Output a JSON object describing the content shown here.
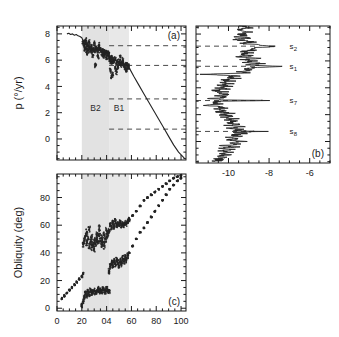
{
  "figure": {
    "background": "#ffffff",
    "frame_color": "#1a1a1a",
    "band_color": "#e2e2e2",
    "data_color": "#242424"
  },
  "panels": {
    "a": {
      "id_label": "(a)",
      "ylabel": "p (°/yr)",
      "yticks": [
        "0",
        "2",
        "4",
        "6",
        "8"
      ],
      "ytick_values": [
        0,
        2,
        4,
        6,
        8
      ],
      "ylim": [
        -1.6,
        8.6
      ],
      "xlim": [
        0,
        104
      ],
      "xticks_major": [
        0,
        20,
        40,
        60,
        80,
        100
      ],
      "bands": [
        {
          "label": "B2",
          "x0": 20,
          "x1": 42
        },
        {
          "label": "B1",
          "x0": 42,
          "x1": 58
        }
      ],
      "resonance_lines": [
        7.1,
        5.6,
        3.05,
        0.75
      ]
    },
    "b": {
      "id_label": "(b)",
      "xlabel": "",
      "xticks": [
        "-10",
        "-8",
        "-6"
      ],
      "xtick_values": [
        -10,
        -8,
        -6
      ],
      "xlim": [
        -11.6,
        -5.0
      ],
      "ylim": [
        -1.6,
        8.6
      ],
      "peak_labels": [
        {
          "text": "s",
          "sub": "2",
          "p": 7.1
        },
        {
          "text": "s",
          "sub": "1",
          "p": 5.6
        },
        {
          "text": "s",
          "sub": "7",
          "p": 3.05
        },
        {
          "text": "s",
          "sub": "8",
          "p": 0.75
        }
      ]
    },
    "c": {
      "id_label": "(c)",
      "ylabel": "Obliquity (deg)",
      "yticks": [
        "0",
        "20",
        "40",
        "60",
        "80"
      ],
      "ytick_values": [
        0,
        20,
        40,
        60,
        80
      ],
      "ylim": [
        -2,
        97
      ],
      "xlim": [
        0,
        104
      ],
      "xticks": [
        "0",
        "20",
        "04",
        "60",
        "80",
        "100"
      ],
      "xtick_values": [
        0,
        20,
        40,
        60,
        80,
        100
      ],
      "bands": [
        {
          "label": "B2",
          "x0": 20,
          "x1": 42
        },
        {
          "label": "B1",
          "x0": 42,
          "x1": 58
        }
      ]
    }
  },
  "chart_data": {
    "type": "scatter",
    "title": "",
    "panel_a": {
      "type": "scatter",
      "xlabel": "",
      "ylabel": "p (°/yr)",
      "xlim": [
        0,
        104
      ],
      "ylim": [
        -1.6,
        8.6
      ],
      "grid": false,
      "series": [
        {
          "name": "precession-rate-branch-upper",
          "comment": "smooth track from x~8 to x~21 near p=8",
          "x": [
            8,
            9.5,
            11,
            12.5,
            14,
            15.5,
            17,
            18.5,
            20,
            21
          ],
          "y": [
            8.0,
            8.05,
            7.95,
            8.0,
            7.9,
            7.95,
            7.85,
            7.8,
            7.7,
            7.5
          ]
        },
        {
          "name": "precession-rate-scatter-B2",
          "comment": "dense chaotic scatter inside band B2",
          "x": [
            21,
            22,
            22.5,
            23,
            24,
            24.5,
            25,
            26,
            27,
            27.5,
            28,
            29,
            30,
            31,
            32,
            33,
            34,
            35,
            36,
            37,
            38,
            39,
            40,
            41,
            41.8,
            23,
            26,
            30,
            34,
            38,
            40,
            24,
            29,
            33,
            37,
            31
          ],
          "y": [
            7.4,
            7.1,
            6.8,
            7.3,
            6.9,
            7.2,
            6.7,
            6.95,
            6.8,
            7.05,
            6.75,
            6.85,
            6.7,
            6.9,
            6.8,
            6.7,
            6.85,
            6.75,
            6.6,
            6.7,
            6.65,
            6.6,
            6.55,
            6.5,
            6.45,
            7.5,
            7.4,
            7.3,
            7.15,
            6.35,
            6.2,
            6.6,
            6.4,
            6.3,
            6.45,
            5.6
          ]
        },
        {
          "name": "precession-rate-scatter-B1",
          "comment": "scatter inside band B1 clustering near 5.6",
          "x": [
            42,
            42.5,
            43,
            43.5,
            44,
            44.5,
            45,
            46,
            47,
            48,
            49,
            50,
            51,
            52,
            53,
            54,
            55,
            56,
            57,
            57.8,
            43,
            45,
            47,
            49,
            51,
            53,
            55,
            44,
            48,
            52,
            56
          ],
          "y": [
            6.3,
            6.0,
            6.15,
            5.9,
            6.2,
            5.85,
            6.05,
            5.95,
            6.1,
            5.8,
            5.9,
            5.75,
            5.85,
            5.7,
            5.8,
            5.65,
            5.7,
            5.6,
            5.55,
            5.5,
            5.2,
            4.9,
            5.35,
            5.5,
            6.2,
            6.0,
            5.4,
            4.7,
            5.1,
            5.65,
            5.3
          ]
        },
        {
          "name": "precession-rate-branch-lower",
          "comment": "near linear decline from (58,5.5) to (103,-1.5)",
          "x": [
            58,
            62,
            66,
            70,
            74,
            78,
            82,
            86,
            90,
            94,
            98,
            103
          ],
          "y": [
            5.45,
            4.75,
            4.1,
            3.45,
            2.8,
            2.15,
            1.5,
            0.85,
            0.2,
            -0.45,
            -1.0,
            -1.5
          ]
        }
      ],
      "shaded_bands": [
        {
          "label": "B2",
          "x0": 20,
          "x1": 42
        },
        {
          "label": "B1",
          "x0": 42,
          "x1": 58
        }
      ],
      "horizontal_dashed_lines": [
        7.1,
        5.6,
        3.05,
        0.75
      ]
    },
    "panel_b": {
      "type": "line",
      "comment": "frequency-analysis amplitude spectrum plotted sideways; x axis is log amplitude, y axis is p (deg/yr)",
      "xlabel": "",
      "ylabel": "p (°/yr)",
      "xlim": [
        -11.6,
        -5.0
      ],
      "ylim": [
        -1.6,
        8.6
      ],
      "grid": false,
      "annotations": [
        {
          "label": "s2",
          "p": 7.1,
          "amplitude": -7.6
        },
        {
          "label": "s1",
          "p": 5.6,
          "amplitude": -7.4
        },
        {
          "label": "s7",
          "p": 3.05,
          "amplitude": -7.7
        },
        {
          "label": "s8",
          "p": 0.75,
          "amplitude": -8.3
        }
      ],
      "spectrum": {
        "p": [
          8.6,
          8.45,
          8.3,
          8.15,
          8.0,
          7.9,
          7.8,
          7.7,
          7.6,
          7.5,
          7.4,
          7.3,
          7.2,
          7.1,
          7.0,
          6.9,
          6.8,
          6.7,
          6.6,
          6.5,
          6.4,
          6.3,
          6.2,
          6.1,
          6.0,
          5.9,
          5.8,
          5.7,
          5.6,
          5.5,
          5.4,
          5.3,
          5.2,
          5.1,
          5.0,
          4.9,
          4.8,
          4.7,
          4.6,
          4.5,
          4.4,
          4.3,
          4.2,
          4.1,
          4.0,
          3.9,
          3.8,
          3.7,
          3.6,
          3.5,
          3.4,
          3.3,
          3.2,
          3.1,
          3.05,
          3.0,
          2.9,
          2.8,
          2.7,
          2.6,
          2.5,
          2.4,
          2.3,
          2.2,
          2.1,
          2.0,
          1.9,
          1.8,
          1.7,
          1.6,
          1.5,
          1.4,
          1.3,
          1.2,
          1.1,
          1.0,
          0.9,
          0.8,
          0.75,
          0.7,
          0.6,
          0.5,
          0.4,
          0.3,
          0.2,
          0.1,
          0.0,
          -0.1,
          -0.2,
          -0.3,
          -0.4,
          -0.5,
          -0.6,
          -0.7,
          -0.8,
          -0.9,
          -1.0,
          -1.1,
          -1.2,
          -1.3,
          -1.4,
          -1.5
        ],
        "amplitude": [
          -9.3,
          -9.0,
          -9.5,
          -8.9,
          -9.4,
          -9.1,
          -9.7,
          -9.0,
          -9.6,
          -9.2,
          -8.8,
          -9.4,
          -8.6,
          -7.6,
          -8.5,
          -9.0,
          -8.7,
          -9.3,
          -8.8,
          -9.4,
          -8.9,
          -9.5,
          -8.6,
          -9.2,
          -8.7,
          -9.3,
          -8.4,
          -9.0,
          -7.4,
          -8.8,
          -9.3,
          -8.9,
          -9.6,
          -9.1,
          -11.2,
          -9.4,
          -10.0,
          -9.6,
          -10.2,
          -9.8,
          -10.4,
          -9.9,
          -10.5,
          -10.0,
          -10.6,
          -10.1,
          -10.7,
          -10.2,
          -10.5,
          -10.0,
          -10.6,
          -10.1,
          -10.8,
          -10.3,
          -7.7,
          -10.4,
          -10.9,
          -10.3,
          -11.3,
          -10.5,
          -10.2,
          -10.6,
          -10.1,
          -10.5,
          -9.9,
          -10.4,
          -9.8,
          -10.3,
          -9.7,
          -10.2,
          -9.6,
          -10.1,
          -9.5,
          -10.0,
          -9.4,
          -9.9,
          -9.3,
          -9.7,
          -8.3,
          -9.6,
          -9.2,
          -9.8,
          -9.4,
          -10.0,
          -9.5,
          -10.1,
          -9.3,
          -9.9,
          -9.6,
          -10.2,
          -9.7,
          -10.3,
          -9.8,
          -10.4,
          -9.9,
          -10.5,
          -10.0,
          -10.6,
          -10.1,
          -10.7,
          -10.3,
          -11.0
        ]
      }
    },
    "panel_c": {
      "type": "scatter",
      "xlabel": "",
      "ylabel": "Obliquity (deg)",
      "xlim": [
        0,
        104
      ],
      "ylim": [
        -2,
        97
      ],
      "grid": false,
      "series": [
        {
          "name": "obliquity-lower-track",
          "comment": "rising track from x~4,obl~8 to x~21,obl~25",
          "x": [
            4,
            6,
            8,
            10,
            12,
            14,
            16,
            18,
            20,
            21
          ],
          "y": [
            7,
            9,
            11,
            13,
            15,
            17,
            19,
            21,
            23,
            25
          ]
        },
        {
          "name": "obliquity-scatter-mid-B2",
          "comment": "cluster near 45-55 deg inside B2",
          "x": [
            21,
            22,
            23,
            24,
            25,
            26,
            27,
            28,
            29,
            30,
            31,
            32,
            33,
            34,
            35,
            36,
            37,
            38,
            39,
            40,
            41,
            24,
            28,
            32,
            36,
            40,
            26,
            30,
            34,
            38
          ],
          "y": [
            46,
            49,
            52,
            47,
            50,
            45,
            48,
            51,
            46,
            49,
            47,
            50,
            48,
            52,
            49,
            51,
            48,
            53,
            50,
            52,
            54,
            55,
            44,
            53,
            46,
            56,
            57,
            43,
            58,
            45
          ]
        },
        {
          "name": "obliquity-scatter-low-B2",
          "comment": "cluster near 5-15 deg inside B2",
          "x": [
            20,
            21,
            22,
            23,
            24,
            25,
            26,
            27,
            28,
            29,
            30,
            31,
            32,
            33,
            34,
            35,
            36,
            37,
            38,
            39,
            40,
            41,
            42
          ],
          "y": [
            2,
            5,
            8,
            11,
            9,
            12,
            10,
            13,
            11,
            12,
            13,
            11,
            12,
            14,
            12,
            13,
            12,
            14,
            13,
            12,
            14,
            13,
            12
          ]
        },
        {
          "name": "obliquity-scatter-mid-B1",
          "comment": "cluster near 58-64 deg in B1",
          "x": [
            42,
            43,
            44,
            45,
            46,
            47,
            48,
            49,
            50,
            51,
            52,
            53,
            54,
            55,
            56,
            57,
            58
          ],
          "y": [
            56,
            60,
            58,
            62,
            59,
            63,
            60,
            61,
            60,
            62,
            60,
            61,
            60,
            62,
            61,
            63,
            64
          ]
        },
        {
          "name": "obliquity-scatter-low-B1",
          "comment": "cluster near 28-38 deg in B1",
          "x": [
            42,
            43,
            44,
            45,
            46,
            47,
            48,
            49,
            50,
            51,
            52,
            53,
            54,
            55,
            56,
            57
          ],
          "y": [
            27,
            30,
            33,
            31,
            34,
            32,
            35,
            33,
            31,
            34,
            32,
            36,
            34,
            37,
            35,
            38
          ]
        },
        {
          "name": "obliquity-upper-branch",
          "comment": "rising branch from (58,64) to (100,96) with gap near 70",
          "x": [
            58,
            61,
            64,
            67,
            70,
            73,
            76,
            79,
            82,
            85,
            88,
            91,
            94,
            97,
            100
          ],
          "y": [
            64,
            67,
            70,
            74,
            78,
            80,
            82,
            84,
            86,
            88,
            90,
            92,
            94,
            95,
            96
          ]
        },
        {
          "name": "obliquity-lower-branch",
          "comment": "rising branch from (58,40) to (100,94)",
          "x": [
            58,
            61,
            64,
            67,
            70,
            73,
            76,
            79,
            82,
            85,
            88,
            91,
            94,
            97,
            100
          ],
          "y": [
            40,
            45,
            50,
            55,
            58,
            62,
            66,
            70,
            74,
            78,
            82,
            86,
            89,
            92,
            94
          ]
        }
      ],
      "shaded_bands": [
        {
          "label": "B2",
          "x0": 20,
          "x1": 42
        },
        {
          "label": "B1",
          "x0": 42,
          "x1": 58
        }
      ]
    }
  }
}
